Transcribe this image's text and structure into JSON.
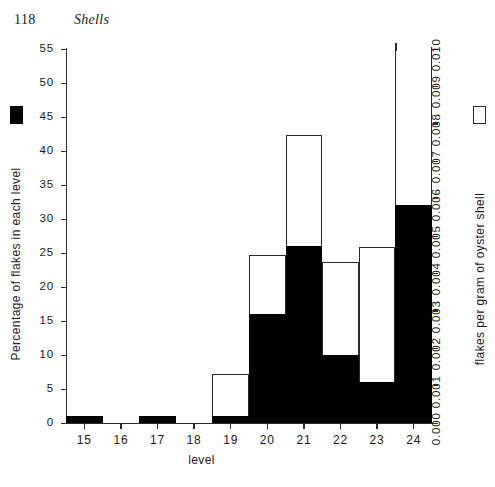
{
  "page": {
    "folio": "118",
    "running_head": "Shells"
  },
  "chart_data": {
    "type": "bar",
    "title": "",
    "xlabel": "level",
    "categories": [
      "15",
      "16",
      "17",
      "18",
      "19",
      "20",
      "21",
      "22",
      "23",
      "24"
    ],
    "grid": false,
    "legend_position": "axis-titles",
    "axes": {
      "left": {
        "label": "Percentage of flakes in each level",
        "ylim": [
          0,
          55
        ],
        "ticks": [
          "0",
          "5",
          "10",
          "15",
          "20",
          "25",
          "30",
          "35",
          "40",
          "45",
          "50",
          "55"
        ],
        "tick_values": [
          0,
          5,
          10,
          15,
          20,
          25,
          30,
          35,
          40,
          45,
          50,
          55
        ],
        "marker": "filled-square"
      },
      "right": {
        "label": "flakes per gram of oyster shell",
        "ylim": [
          0.0,
          0.01
        ],
        "ticks": [
          "0.000",
          "0.001",
          "0.002",
          "0.003",
          "0.004",
          "0.005",
          "0.006",
          "0.007",
          "0.008",
          "0.009",
          "0.010"
        ],
        "tick_values": [
          0.0,
          0.001,
          0.002,
          0.003,
          0.004,
          0.005,
          0.006,
          0.007,
          0.008,
          0.009,
          0.01
        ],
        "marker": "open-square"
      }
    },
    "series": [
      {
        "name": "Percentage of flakes in each level",
        "axis": "left",
        "style": "filled-black",
        "values": [
          1,
          0,
          1,
          0,
          1,
          16,
          26,
          10,
          6,
          32
        ]
      },
      {
        "name": "flakes per gram of oyster shell",
        "axis": "right",
        "style": "open-outline",
        "values": [
          0,
          0,
          0,
          0,
          0.0013,
          0.0045,
          0.0077,
          0.0043,
          0.0047,
          0.0108
        ],
        "notes": "level 24 bar extends above the top of the plot frame"
      }
    ]
  }
}
